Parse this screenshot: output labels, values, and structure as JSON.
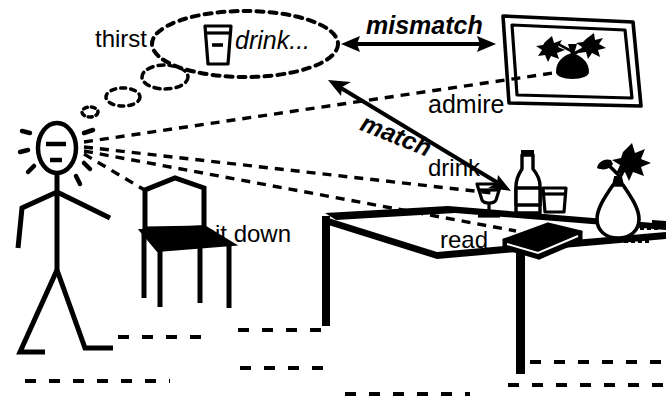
{
  "scene": {
    "title": "Action affordance diagram: person perceiving objects in a room",
    "background_color": "#ffffff",
    "ink_color": "#000000",
    "width": 666,
    "height": 397
  },
  "labels": {
    "thirst": "thirst",
    "drink_thought": "drink...",
    "mismatch": "mismatch",
    "admire": "admire",
    "match": "match",
    "drink": "drink",
    "sit_down": "sit down",
    "read": "read"
  },
  "objects": {
    "person": "stick-figure-person",
    "thought_bubble": "thought-bubble-drink",
    "thought_bubble_contents": "glass-of-water-icon",
    "picture_frame": "framed-picture-of-flowers",
    "chair": "chair",
    "table": "table",
    "wine_glass": "wine-glass",
    "bottle": "bottle",
    "book": "book",
    "vase": "vase-with-flower",
    "floor": "floor-dashed-lines"
  },
  "relations": [
    {
      "from": "thought-bubble-drink",
      "to": "framed-picture-of-flowers",
      "label": "mismatch",
      "arrow": "double"
    },
    {
      "from": "thought-bubble-drink",
      "to": "wine-glass-and-bottle",
      "label": "match",
      "arrow": "double"
    },
    {
      "from": "person-gaze",
      "to": "framed-picture-of-flowers",
      "label": "admire",
      "line": "dashed"
    },
    {
      "from": "person-gaze",
      "to": "wine-glass",
      "label": "drink",
      "line": "dashed"
    },
    {
      "from": "person-gaze",
      "to": "chair",
      "label": "sit down",
      "line": "dashed"
    },
    {
      "from": "person-gaze",
      "to": "book",
      "label": "read",
      "line": "dashed"
    }
  ]
}
